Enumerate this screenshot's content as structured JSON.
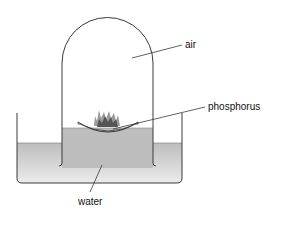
{
  "diagram": {
    "labels": {
      "air": "air",
      "phosphorus": "phosphorus",
      "water": "water"
    },
    "colors": {
      "outline": "#3a3a3a",
      "water": "#c8c8c8",
      "water_light": "#e2e2e2",
      "flame_dark": "#4a4a4a",
      "flame_light": "#9a9a9a",
      "background": "#ffffff"
    }
  }
}
